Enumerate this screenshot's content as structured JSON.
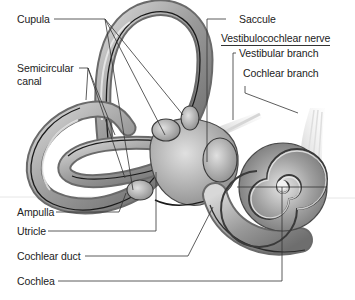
{
  "diagram": {
    "labels_left": {
      "cupula": "Cupula",
      "semicircular_canal_1": "Semicircular",
      "semicircular_canal_2": "canal",
      "ampulla": "Ampulla",
      "utricle": "Utricle",
      "cochlear_duct": "Cochlear duct",
      "cochlea": "Cochlea"
    },
    "labels_right": {
      "saccule": "Saccule",
      "vestibulocochlear_nerve": "Vestibulocochlear nerve",
      "vestibular_branch": "Vestibular branch",
      "cochlear_branch": "Cochlear branch"
    },
    "colors": {
      "background": "#ffffff",
      "label_text": "#222222",
      "leader_line": "#333333",
      "structure_fill": "#a8a8a8",
      "structure_dark": "#555555",
      "endolymph_line": "#1a1a1a",
      "nerve_fill": "#e4e4e4"
    }
  }
}
